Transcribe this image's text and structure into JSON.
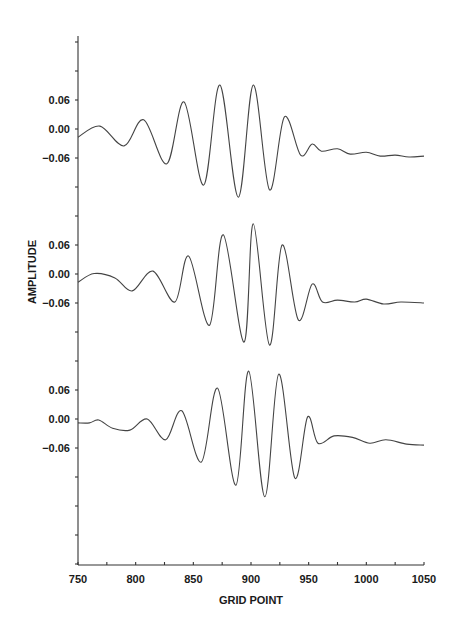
{
  "chart_data": {
    "type": "line",
    "title": "",
    "xlabel": "GRID POINT",
    "ylabel": "AMPLITUDE",
    "xlim": [
      750,
      1050
    ],
    "x_ticks": [
      750,
      800,
      850,
      900,
      950,
      1000,
      1050
    ],
    "x_tick_labels": [
      "750",
      "800",
      "850",
      "900",
      "950",
      "1000",
      "1050"
    ],
    "x_minor_step": 25,
    "grid": false,
    "legend": null,
    "layout": "three vertically offset traces sharing one x-axis",
    "series": [
      {
        "name": "trace-1 (top)",
        "y_tick_labels": [
          "0.06",
          "0.00",
          "−0.06"
        ],
        "points": [
          [
            750,
            -0.017
          ],
          [
            769,
            0.006
          ],
          [
            790,
            -0.035
          ],
          [
            807,
            0.019
          ],
          [
            827,
            -0.072
          ],
          [
            842,
            0.056
          ],
          [
            859,
            -0.116
          ],
          [
            873,
            0.091
          ],
          [
            889,
            -0.141
          ],
          [
            902,
            0.091
          ],
          [
            916,
            -0.126
          ],
          [
            929,
            0.025
          ],
          [
            943,
            -0.054
          ],
          [
            953,
            -0.031
          ],
          [
            961,
            -0.046
          ],
          [
            975,
            -0.041
          ],
          [
            986,
            -0.052
          ],
          [
            1000,
            -0.048
          ],
          [
            1012,
            -0.056
          ],
          [
            1025,
            -0.054
          ],
          [
            1037,
            -0.058
          ],
          [
            1050,
            -0.056
          ]
        ]
      },
      {
        "name": "trace-2 (middle)",
        "y_tick_labels": [
          "0.06",
          "0.00",
          "−0.06"
        ],
        "points": [
          [
            750,
            -0.017
          ],
          [
            764,
            0.001
          ],
          [
            782,
            -0.008
          ],
          [
            797,
            -0.035
          ],
          [
            815,
            0.006
          ],
          [
            834,
            -0.058
          ],
          [
            846,
            0.037
          ],
          [
            864,
            -0.106
          ],
          [
            876,
            0.081
          ],
          [
            894,
            -0.141
          ],
          [
            902,
            0.104
          ],
          [
            916,
            -0.147
          ],
          [
            927,
            0.06
          ],
          [
            941,
            -0.095
          ],
          [
            953,
            -0.021
          ],
          [
            962,
            -0.058
          ],
          [
            975,
            -0.054
          ],
          [
            990,
            -0.058
          ],
          [
            1000,
            -0.052
          ],
          [
            1015,
            -0.062
          ],
          [
            1030,
            -0.058
          ],
          [
            1050,
            -0.06
          ]
        ]
      },
      {
        "name": "trace-3 (bottom)",
        "y_tick_labels": [
          "0.06",
          "0.00",
          "−0.06"
        ],
        "points": [
          [
            750,
            -0.008
          ],
          [
            760,
            -0.008
          ],
          [
            768,
            -0.002
          ],
          [
            780,
            -0.019
          ],
          [
            795,
            -0.023
          ],
          [
            810,
            0.0
          ],
          [
            826,
            -0.043
          ],
          [
            840,
            0.017
          ],
          [
            857,
            -0.089
          ],
          [
            871,
            0.064
          ],
          [
            887,
            -0.137
          ],
          [
            898,
            0.099
          ],
          [
            912,
            -0.161
          ],
          [
            924,
            0.093
          ],
          [
            938,
            -0.122
          ],
          [
            949,
            0.004
          ],
          [
            958,
            -0.05
          ],
          [
            972,
            -0.035
          ],
          [
            988,
            -0.038
          ],
          [
            1003,
            -0.05
          ],
          [
            1017,
            -0.043
          ],
          [
            1035,
            -0.052
          ],
          [
            1050,
            -0.054
          ]
        ]
      }
    ]
  },
  "colors": {
    "trace": "#444444",
    "axis": "#333333",
    "text": "#1a1a1a",
    "background": "#ffffff"
  }
}
